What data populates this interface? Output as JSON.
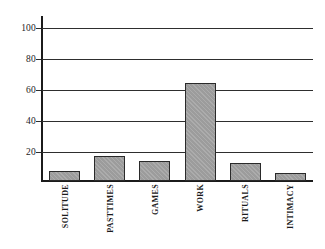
{
  "chart_data": {
    "type": "bar",
    "title": "",
    "subtitle": "",
    "xlabel": "",
    "ylabel": "",
    "categories": [
      "SOLITUDE",
      "PASTTIMES",
      "GAMES",
      "WORK",
      "RITUALS",
      "INTIMACY"
    ],
    "values": [
      6,
      15,
      12,
      60,
      11,
      5
    ],
    "ylim": [
      0,
      100
    ],
    "yticks": [
      20,
      40,
      60,
      80,
      100
    ],
    "ytick_labels": [
      "20",
      "40",
      "60",
      "80",
      "100"
    ],
    "grid": true,
    "grid_axis": "y",
    "legend": null,
    "legend_position": "none",
    "annotations": [],
    "series": [
      {
        "name": "activity",
        "values": [
          6,
          15,
          12,
          60,
          11,
          5
        ]
      }
    ],
    "colors": {
      "bar_fill": "#9c9c9c",
      "bar_border": "#2a2a2a",
      "axis": "#1b1b1b",
      "grid": "#2e2e2e",
      "background": "#ffffff",
      "text": "#1b1b1b"
    }
  }
}
